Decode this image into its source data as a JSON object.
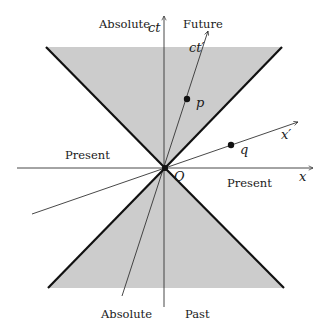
{
  "diagram": {
    "colors": {
      "cone_fill": "#cccccc",
      "cone_edge": "#111111",
      "axis": "#333333",
      "text": "#1a1a1a",
      "background": "#ffffff"
    },
    "axes": {
      "ct_label": "ct",
      "x_label": "x",
      "ct_prime_label": "ct′",
      "x_prime_label": "x′",
      "origin_label": "O"
    },
    "regions": {
      "absolute_future_line1": "Absolute",
      "absolute_future_line2": "Future",
      "absolute_past_line1": "Absolute",
      "absolute_past_line2": "Past",
      "present_left": "Present",
      "present_right": "Present"
    },
    "events": [
      {
        "label": "p",
        "description": "event inside future light cone on ct′ axis"
      },
      {
        "label": "q",
        "description": "event outside light cone on x′ axis"
      }
    ],
    "geometry": {
      "origin": [
        165,
        168
      ],
      "future_cone": {
        "top_left": [
          46,
          47
        ],
        "top_right": [
          282,
          47
        ]
      },
      "past_cone": {
        "bottom_left": [
          48,
          288
        ],
        "bottom_right": [
          284,
          288
        ]
      },
      "ct_axis": {
        "from": [
          164,
          307
        ],
        "to": [
          164,
          16
        ]
      },
      "x_axis": {
        "from": [
          17,
          168
        ],
        "to": [
          313,
          168
        ]
      },
      "ct_prime_axis": {
        "from": [
          122,
          296
        ],
        "to": [
          208,
          31
        ]
      },
      "x_prime_axis": {
        "from": [
          32,
          214
        ],
        "to": [
          298,
          122
        ]
      },
      "p": [
        187,
        99
      ],
      "q": [
        231,
        145
      ]
    }
  }
}
